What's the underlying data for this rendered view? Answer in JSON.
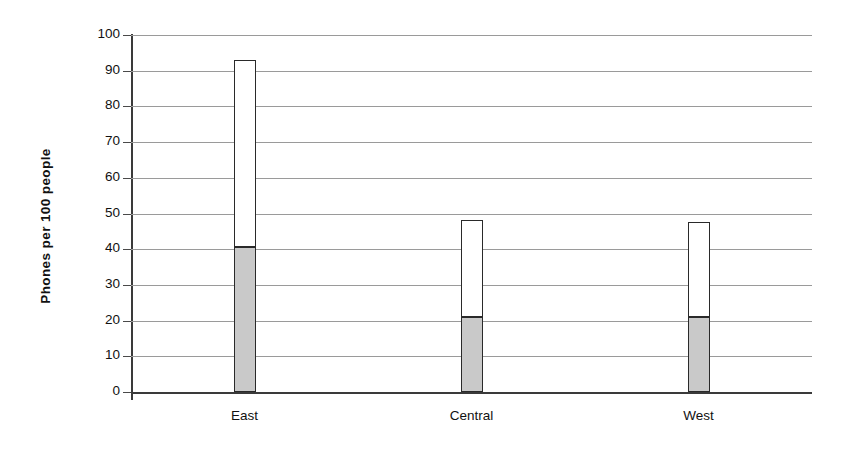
{
  "chart_data": {
    "type": "bar",
    "subtype": "stacked-vertical",
    "title": "",
    "xlabel": "",
    "ylabel": "Phones per 100 people",
    "categories": [
      "East",
      "Central",
      "West"
    ],
    "series": [
      {
        "name": "lower-segment",
        "color": "#c9c9c9",
        "values": [
          40.5,
          21,
          21
        ]
      },
      {
        "name": "upper-segment",
        "color": "#ffffff",
        "values": [
          52.5,
          27.2,
          26.6
        ]
      }
    ],
    "totals": [
      93,
      48.2,
      47.6
    ],
    "ylim": [
      0,
      100
    ],
    "ytick_step": 10,
    "yticks": [
      100,
      90,
      80,
      70,
      60,
      50,
      40,
      30,
      20,
      10,
      0
    ],
    "ytick_labels": [
      "100",
      "90",
      "80",
      "70",
      "60",
      "50",
      "40",
      "30",
      "20",
      "10",
      "0"
    ],
    "grid": true,
    "grid_axis": "y",
    "legend": false,
    "legend_position": "none",
    "background": "#ffffff",
    "gridline_color": "#9a9a9a",
    "axis_color": "#3a3a3a",
    "bar_outline_color": "#2a2a2a"
  }
}
